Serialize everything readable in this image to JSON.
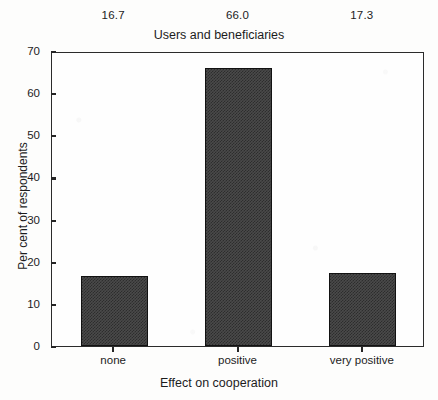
{
  "chart_data": {
    "type": "bar",
    "title": "Users and beneficiaries",
    "xlabel": "Effect on cooperation",
    "ylabel": "Per cent of respondents",
    "categories": [
      "none",
      "positive",
      "very positive"
    ],
    "values": [
      16.7,
      66.0,
      17.3
    ],
    "data_labels": [
      "16.7",
      "66.0",
      "17.3"
    ],
    "ylim": [
      0,
      70
    ],
    "yticks": [
      0,
      10,
      20,
      30,
      40,
      50,
      60,
      70
    ],
    "ytick_labels": [
      "0",
      "10",
      "20",
      "30",
      "40",
      "50",
      "60",
      "70"
    ],
    "grid": false,
    "legend": false,
    "bar_color": "#4a4a4a",
    "bar_edge_color": "#121212",
    "axis_color": "#2b2b2b",
    "background_color": "#fdfdfc"
  }
}
